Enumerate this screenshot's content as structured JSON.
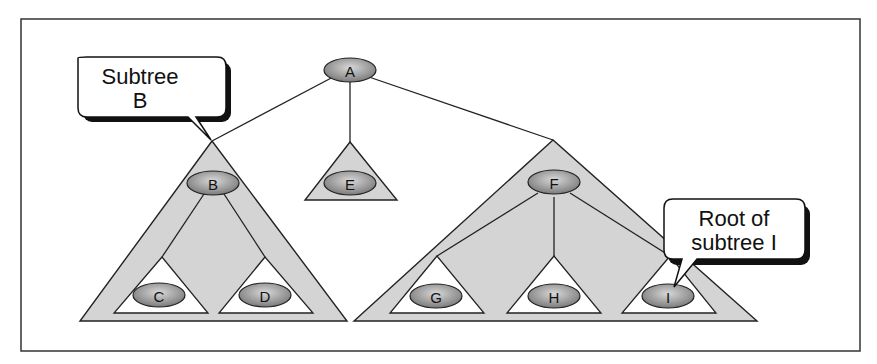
{
  "diagram": {
    "title": "",
    "colors": {
      "frame": "#333333",
      "subtree_fill": "#d4d4d4",
      "inner_subtree_fill": "#ffffff",
      "node_fill_light": "#cfcfcf",
      "node_fill_dark": "#7a7a7a",
      "edge": "#222222",
      "callout_shadow": "#111111"
    },
    "nodes": [
      {
        "id": "A",
        "label": "A",
        "role": "root"
      },
      {
        "id": "B",
        "label": "B",
        "role": "subtree-root"
      },
      {
        "id": "C",
        "label": "C",
        "role": "leaf-subtree"
      },
      {
        "id": "D",
        "label": "D",
        "role": "leaf-subtree"
      },
      {
        "id": "E",
        "label": "E",
        "role": "subtree-root"
      },
      {
        "id": "F",
        "label": "F",
        "role": "subtree-root"
      },
      {
        "id": "G",
        "label": "G",
        "role": "leaf-subtree"
      },
      {
        "id": "H",
        "label": "H",
        "role": "leaf-subtree"
      },
      {
        "id": "I",
        "label": "I",
        "role": "leaf-subtree"
      }
    ],
    "edges": [
      [
        "A",
        "B"
      ],
      [
        "A",
        "E"
      ],
      [
        "A",
        "F"
      ],
      [
        "B",
        "C"
      ],
      [
        "B",
        "D"
      ],
      [
        "F",
        "G"
      ],
      [
        "F",
        "H"
      ],
      [
        "F",
        "I"
      ]
    ],
    "callouts": [
      {
        "id": "subtree-b",
        "lines": [
          "Subtree",
          "B"
        ],
        "points_to": "B subtree apex"
      },
      {
        "id": "root-of-subtree-i",
        "lines": [
          "Root of",
          "subtree I"
        ],
        "points_to": "I"
      }
    ]
  }
}
